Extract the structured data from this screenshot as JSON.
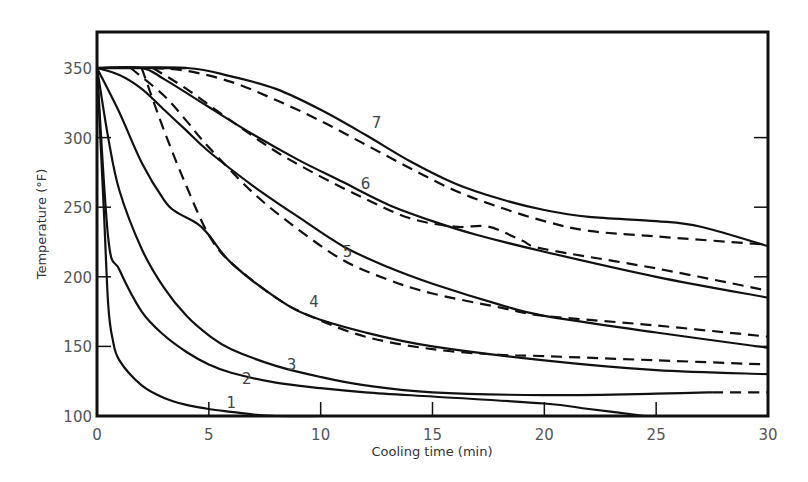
{
  "chart_data": {
    "type": "line",
    "title": "",
    "xlabel": "Cooling time (min)",
    "ylabel": "Temperature (°F)",
    "xlim": [
      0,
      30
    ],
    "ylim": [
      100,
      350
    ],
    "xticks": [
      0,
      5,
      10,
      15,
      20,
      25,
      30
    ],
    "yticks": [
      100,
      150,
      200,
      250,
      300,
      350
    ],
    "grid": false,
    "legend": "none (curves labeled inline 1-7; solid and dashed variants)",
    "series": [
      {
        "name": "1",
        "style": "solid",
        "x": [
          0,
          0.3,
          0.5,
          0.7,
          1,
          2,
          3,
          4,
          5,
          6,
          7,
          8,
          10
        ],
        "y": [
          350,
          250,
          180,
          155,
          140,
          122,
          113,
          108,
          105,
          103,
          101,
          100,
          100
        ]
      },
      {
        "name": "2",
        "style": "solid",
        "x": [
          0,
          0.5,
          1,
          2,
          3,
          4,
          5,
          6,
          8,
          10,
          12,
          15,
          20,
          22,
          24.5
        ],
        "y": [
          350,
          228,
          205,
          175,
          158,
          146,
          137,
          131,
          124,
          120,
          117,
          114,
          109,
          105,
          100
        ]
      },
      {
        "name": "3",
        "style": "solid",
        "x": [
          0,
          0.5,
          1,
          2,
          3,
          4,
          5,
          6,
          8,
          10,
          12,
          15,
          20,
          25,
          27.5
        ],
        "y": [
          350,
          300,
          262,
          220,
          192,
          172,
          158,
          148,
          136,
          128,
          122,
          117,
          115,
          116,
          117
        ]
      },
      {
        "name": "3",
        "style": "dashed",
        "x": [
          27.5,
          30
        ],
        "y": [
          117,
          117
        ]
      },
      {
        "name": "4",
        "style": "solid",
        "x": [
          0,
          1,
          2,
          3,
          3.5,
          4.5,
          5,
          6,
          8,
          9.5,
          12,
          15,
          20,
          25,
          30
        ],
        "y": [
          350,
          318,
          282,
          255,
          247,
          238,
          230,
          210,
          185,
          172,
          160,
          150,
          140,
          133,
          130
        ]
      },
      {
        "name": "4",
        "style": "dashed",
        "x": [
          2,
          3,
          4,
          5,
          6,
          8,
          9.5,
          12,
          15,
          18,
          20,
          25,
          30
        ],
        "y": [
          350,
          305,
          265,
          230,
          210,
          185,
          172,
          157,
          148,
          144,
          143,
          140,
          137
        ]
      },
      {
        "name": "5",
        "style": "solid",
        "x": [
          0,
          1,
          2,
          3,
          4,
          5,
          7,
          9,
          11,
          13,
          15,
          18,
          20,
          25,
          30
        ],
        "y": [
          350,
          345,
          335,
          320,
          305,
          290,
          265,
          243,
          222,
          207,
          195,
          180,
          172,
          160,
          149
        ]
      },
      {
        "name": "5",
        "style": "dashed",
        "x": [
          1.5,
          3,
          4,
          5,
          7,
          9,
          11,
          13,
          15,
          18,
          20,
          25,
          30
        ],
        "y": [
          350,
          330,
          312,
          293,
          260,
          234,
          212,
          198,
          188,
          178,
          172,
          165,
          157
        ]
      },
      {
        "name": "6",
        "style": "solid",
        "x": [
          0,
          2,
          3,
          5,
          7,
          9,
          11,
          13,
          15,
          17,
          20,
          25,
          30
        ],
        "y": [
          350,
          350,
          342,
          322,
          302,
          284,
          268,
          252,
          240,
          230,
          218,
          200,
          185
        ]
      },
      {
        "name": "6",
        "style": "dashed",
        "x": [
          2.5,
          4,
          6,
          8,
          10,
          12,
          14,
          16,
          17.5,
          19,
          20,
          25,
          30
        ],
        "y": [
          350,
          335,
          312,
          290,
          272,
          256,
          242,
          236,
          236,
          226,
          220,
          206,
          190
        ]
      },
      {
        "name": "7",
        "style": "solid",
        "x": [
          0,
          4,
          6,
          8,
          10,
          12,
          14,
          16,
          18,
          20,
          22,
          25,
          27,
          30
        ],
        "y": [
          350,
          350,
          344,
          335,
          320,
          302,
          283,
          267,
          256,
          248,
          243,
          240,
          236,
          222
        ]
      },
      {
        "name": "7",
        "style": "dashed",
        "x": [
          2.5,
          4,
          6,
          8,
          10,
          12,
          14,
          16,
          18,
          20,
          22,
          25,
          30
        ],
        "y": [
          350,
          348,
          340,
          327,
          312,
          295,
          278,
          262,
          250,
          240,
          233,
          229,
          223
        ]
      }
    ],
    "annotations": [
      {
        "text": "1",
        "x": 6.0,
        "y": 106
      },
      {
        "text": "2",
        "x": 6.7,
        "y": 123
      },
      {
        "text": "3",
        "x": 8.7,
        "y": 133
      },
      {
        "text": "4",
        "x": 9.7,
        "y": 178
      },
      {
        "text": "5",
        "x": 11.2,
        "y": 214
      },
      {
        "text": "6",
        "x": 12.0,
        "y": 263
      },
      {
        "text": "7",
        "x": 12.5,
        "y": 307
      }
    ]
  }
}
